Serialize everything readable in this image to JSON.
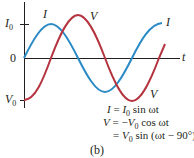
{
  "diagram": {
    "panel_label": "(b)",
    "axes": {
      "horizontal_label": "t",
      "origin_label": "0",
      "y_max_label": {
        "main": "I",
        "sub": "0"
      },
      "y_min_label": {
        "main": "V",
        "sub": "0"
      }
    },
    "curves": [
      {
        "name": "I",
        "label": "I",
        "color": "#2a8ac6",
        "function": "I0 sin ωt"
      },
      {
        "name": "V",
        "label": "V",
        "color": "#b5333f",
        "function": "-V0 cos ωt"
      }
    ],
    "equations": {
      "line1": {
        "lhs": "I",
        "eq": " = ",
        "amp": "I",
        "amp_sub": "0",
        "rest": " sin ωt"
      },
      "line2": {
        "lhs": "V",
        "eq": " = −",
        "amp": "V",
        "amp_sub": "0",
        "rest": " cos ωt"
      },
      "line3": {
        "eq": "= ",
        "amp": "V",
        "amp_sub": "0",
        "rest": " sin (ωt − 90°)"
      }
    }
  }
}
